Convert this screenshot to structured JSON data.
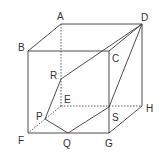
{
  "diagram": {
    "type": "cube-section",
    "colors": {
      "line": "#3a3a3a",
      "text": "#333333",
      "background": "#ffffff"
    },
    "labels": {
      "A": "A",
      "B": "B",
      "C": "C",
      "D": "D",
      "E": "E",
      "F": "F",
      "G": "G",
      "H": "H",
      "P": "P",
      "Q": "Q",
      "R": "R",
      "S": "S"
    },
    "vertices": {
      "A": [
        61,
        24
      ],
      "D": [
        142,
        24
      ],
      "B": [
        28,
        51
      ],
      "C": [
        109,
        51
      ],
      "E": [
        61,
        106
      ],
      "H": [
        142,
        106
      ],
      "F": [
        28,
        133
      ],
      "G": [
        109,
        133
      ],
      "R": [
        61,
        79
      ],
      "P": [
        45,
        119
      ],
      "Q": [
        68,
        133
      ],
      "S": [
        109,
        107
      ]
    },
    "visible_edges": [
      [
        "A",
        "D"
      ],
      [
        "A",
        "B"
      ],
      [
        "B",
        "C"
      ],
      [
        "C",
        "D"
      ],
      [
        "B",
        "F"
      ],
      [
        "F",
        "G"
      ],
      [
        "C",
        "G"
      ],
      [
        "D",
        "H"
      ],
      [
        "G",
        "H"
      ]
    ],
    "hidden_edges": [
      [
        "A",
        "E"
      ],
      [
        "E",
        "H"
      ],
      [
        "E",
        "F"
      ]
    ],
    "section_polygon": [
      "D",
      "R",
      "P",
      "Q",
      "S"
    ]
  }
}
